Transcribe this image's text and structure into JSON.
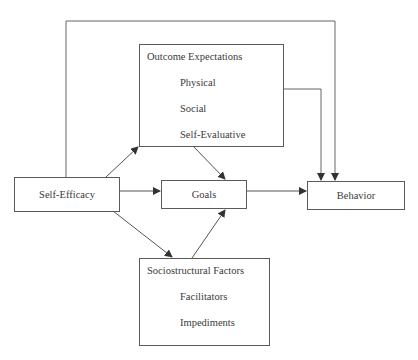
{
  "diagram": {
    "nodes": {
      "self_efficacy": {
        "label": "Self-Efficacy"
      },
      "outcome_expectations": {
        "label": "Outcome Expectations",
        "items": [
          "Physical",
          "Social",
          "Self-Evaluative"
        ]
      },
      "goals": {
        "label": "Goals"
      },
      "behavior": {
        "label": "Behavior"
      },
      "sociostructural_factors": {
        "label": "Sociostructural Factors",
        "items": [
          "Facilitators",
          "Impediments"
        ]
      }
    },
    "edges": [
      {
        "from": "Self-Efficacy",
        "to": "Outcome Expectations"
      },
      {
        "from": "Self-Efficacy",
        "to": "Goals"
      },
      {
        "from": "Self-Efficacy",
        "to": "Sociostructural Factors"
      },
      {
        "from": "Self-Efficacy",
        "to": "Behavior"
      },
      {
        "from": "Outcome Expectations",
        "to": "Goals"
      },
      {
        "from": "Outcome Expectations",
        "to": "Behavior"
      },
      {
        "from": "Sociostructural Factors",
        "to": "Goals"
      },
      {
        "from": "Goals",
        "to": "Behavior"
      }
    ],
    "colors": {
      "line": "#4a4a4a",
      "text": "#3a3a3a",
      "background": "#ffffff"
    }
  }
}
